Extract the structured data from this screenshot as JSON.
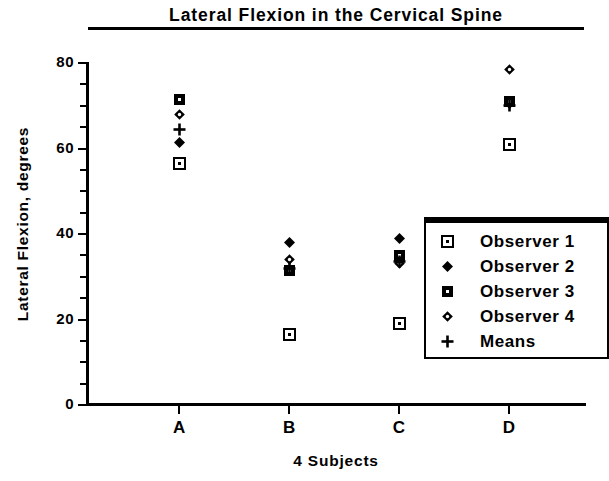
{
  "chart_data": {
    "type": "scatter",
    "title": "Lateral Flexion in the Cervical Spine",
    "xlabel": "4 Subjects",
    "ylabel": "Lateral Flexion, degrees",
    "categories": [
      "A",
      "B",
      "C",
      "D"
    ],
    "ylim": [
      0,
      80
    ],
    "yticks": [
      0,
      20,
      40,
      60,
      80
    ],
    "ytick_labels": [
      "0",
      "20",
      "40",
      "60",
      "80"
    ],
    "yminor_step": 5,
    "grid": false,
    "legend_position": "center-right",
    "series": [
      {
        "name": "Observer 1",
        "marker": "open-square-dot",
        "values": [
          56.5,
          16.5,
          19.0,
          61.0
        ]
      },
      {
        "name": "Observer 2",
        "marker": "filled-diamond",
        "values": [
          61.5,
          38.0,
          39.0,
          70.5
        ]
      },
      {
        "name": "Observer 3",
        "marker": "filled-square-dot",
        "values": [
          71.5,
          31.5,
          35.0,
          71.0
        ]
      },
      {
        "name": "Observer 4",
        "marker": "circle-hole",
        "values": [
          68.0,
          34.0,
          33.0,
          78.5
        ]
      },
      {
        "name": "Means",
        "marker": "plus",
        "values": [
          64.5,
          32.0,
          33.5,
          70.0
        ]
      }
    ]
  },
  "legend": {
    "entries": [
      {
        "label": "Observer 1",
        "marker": "open-square-dot"
      },
      {
        "label": "Observer 2",
        "marker": "filled-diamond"
      },
      {
        "label": "Observer 3",
        "marker": "filled-square-dot"
      },
      {
        "label": "Observer 4",
        "marker": "circle-hole"
      },
      {
        "label": "Means",
        "marker": "plus"
      }
    ]
  },
  "colors": {
    "ink": "#000000",
    "paper": "#ffffff"
  }
}
